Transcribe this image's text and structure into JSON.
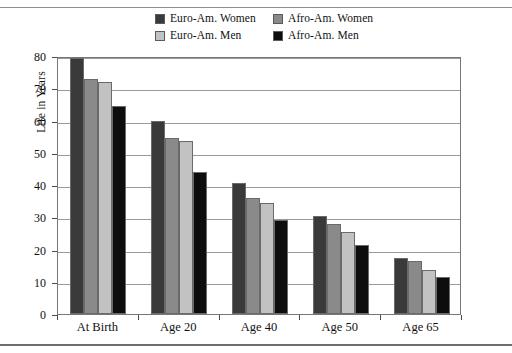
{
  "chart_data": {
    "type": "bar",
    "title": "",
    "subtitle": "",
    "xlabel": "",
    "ylabel": "Life in Years",
    "ylim": [
      0,
      80
    ],
    "yticks": [
      0,
      10,
      20,
      30,
      40,
      50,
      60,
      70,
      80
    ],
    "ytick_labels": [
      "0",
      "10",
      "20",
      "30",
      "40",
      "50",
      "60",
      "70",
      "80"
    ],
    "grid": true,
    "legend_position": "top-center",
    "categories": [
      "At Birth",
      "Age 20",
      "Age 40",
      "Age 50",
      "Age 65"
    ],
    "series": [
      {
        "name": "Euro-Am. Women",
        "color": "#3a3a3a",
        "values": [
          79.5,
          60.0,
          40.5,
          30.5,
          17.5
        ]
      },
      {
        "name": "Afro-Am. Women",
        "color": "#8a8a8a",
        "values": [
          73.0,
          54.5,
          36.0,
          28.0,
          16.5
        ]
      },
      {
        "name": "Euro-Am. Men",
        "color": "#c2c2c2",
        "values": [
          72.0,
          53.5,
          34.5,
          25.5,
          13.5
        ]
      },
      {
        "name": "Afro-Am. Men",
        "color": "#0d0d0d",
        "values": [
          64.5,
          44.0,
          29.0,
          21.5,
          11.5
        ]
      }
    ]
  },
  "legend": {
    "items": [
      {
        "label": "Euro-Am. Women",
        "swatch": "#3a3a3a"
      },
      {
        "label": "Afro-Am. Women",
        "swatch": "#8a8a8a"
      },
      {
        "label": "Euro-Am. Men",
        "swatch": "#c2c2c2"
      },
      {
        "label": "Afro-Am. Men",
        "swatch": "#0d0d0d"
      }
    ]
  }
}
